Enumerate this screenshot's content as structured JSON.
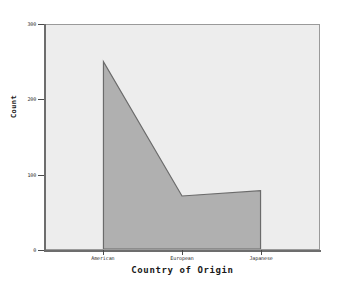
{
  "chart_data": {
    "type": "area",
    "title": "",
    "subtitle": "",
    "xlabel": "Country of Origin",
    "ylabel": "Count",
    "categories": [
      "American",
      "European",
      "Japanese"
    ],
    "values": [
      251,
      71,
      78
    ],
    "series": [
      {
        "name": "Count",
        "values": [
          251,
          71,
          78
        ]
      }
    ],
    "ylim": [
      0,
      300
    ],
    "ytick_labels": [
      "0",
      "100",
      "200",
      "300"
    ],
    "ytick_values": [
      0,
      100,
      200,
      300
    ],
    "xtick_labels": [
      "American",
      "European",
      "Japanese"
    ],
    "grid": false,
    "legend": "none",
    "colors": {
      "area_fill": "#b0b0b0",
      "area_stroke": "#6b6b6b",
      "plot_background": "#ededed",
      "page_background": "#ffffff",
      "axis": "#6d6d6d",
      "text": "#1a1a1a"
    }
  },
  "axis": {
    "y_title": "Count",
    "x_title": "Country of Origin",
    "y_ticks": [
      {
        "label": "300",
        "value": 300
      },
      {
        "label": "200",
        "value": 200
      },
      {
        "label": "100",
        "value": 100
      },
      {
        "label": "0",
        "value": 0
      }
    ],
    "x_ticks": [
      {
        "label": "American"
      },
      {
        "label": "European"
      },
      {
        "label": "Japanese"
      }
    ]
  }
}
